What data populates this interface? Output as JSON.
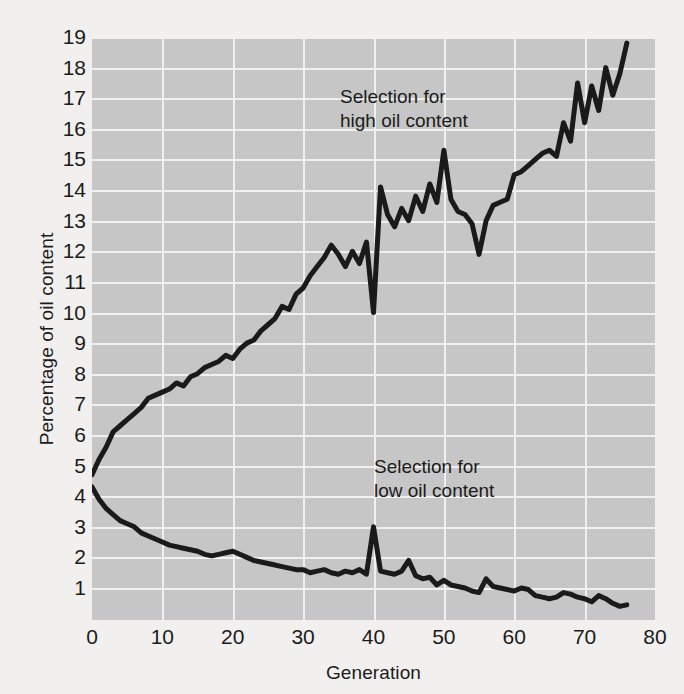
{
  "chart_data": {
    "type": "line",
    "title": "",
    "xlabel": "Generation",
    "ylabel": "Percentage of oil content",
    "xlim": [
      0,
      80
    ],
    "ylim": [
      0,
      19
    ],
    "xticks": [
      0,
      10,
      20,
      30,
      40,
      50,
      60,
      70,
      80
    ],
    "yticks": [
      1,
      2,
      3,
      4,
      5,
      6,
      7,
      8,
      9,
      10,
      11,
      12,
      13,
      14,
      15,
      16,
      17,
      18,
      19
    ],
    "grid": true,
    "legend_position": "inline-annotation",
    "plot_background": "#c6c6c6",
    "gridline_color": "#f0f0f0",
    "line_color": "#1a1a1a",
    "page_background": "#f2f0ee",
    "annotations": [
      {
        "id": "high",
        "text": "Selection for\nhigh oil content",
        "x": 25,
        "y": 16.8
      },
      {
        "id": "low",
        "text": "Selection for\nlow oil content",
        "x": 30,
        "y": 4.1
      }
    ],
    "series": [
      {
        "name": "Selection for high oil content",
        "x": [
          0,
          1,
          2,
          3,
          4,
          5,
          6,
          7,
          8,
          9,
          10,
          11,
          12,
          13,
          14,
          15,
          16,
          17,
          18,
          19,
          20,
          21,
          22,
          23,
          24,
          25,
          26,
          27,
          28,
          29,
          30,
          31,
          32,
          33,
          34,
          35,
          36,
          37,
          38,
          39,
          40,
          41,
          42,
          43,
          44,
          45,
          46,
          47,
          48,
          49,
          50,
          51,
          52,
          53,
          54,
          55,
          56,
          57,
          58,
          59,
          60,
          61,
          62,
          63,
          64,
          65,
          66,
          67,
          68,
          69,
          70,
          71,
          72,
          73,
          74,
          75,
          76
        ],
        "values": [
          4.7,
          5.2,
          5.6,
          6.1,
          6.3,
          6.5,
          6.7,
          6.9,
          7.2,
          7.3,
          7.4,
          7.5,
          7.7,
          7.6,
          7.9,
          8.0,
          8.2,
          8.3,
          8.4,
          8.6,
          8.5,
          8.8,
          9.0,
          9.1,
          9.4,
          9.6,
          9.8,
          10.2,
          10.1,
          10.6,
          10.8,
          11.2,
          11.5,
          11.8,
          12.2,
          11.9,
          11.5,
          12.0,
          11.6,
          12.3,
          10.0,
          14.1,
          13.2,
          12.8,
          13.4,
          13.0,
          13.8,
          13.3,
          14.2,
          13.6,
          15.3,
          13.7,
          13.3,
          13.2,
          12.9,
          11.9,
          13.0,
          13.5,
          13.6,
          13.7,
          14.5,
          14.6,
          14.8,
          15.0,
          15.2,
          15.3,
          15.1,
          16.2,
          15.6,
          17.5,
          16.2,
          17.4,
          16.6,
          18.0,
          17.1,
          17.8,
          18.8
        ]
      },
      {
        "name": "Selection for low oil content",
        "x": [
          0,
          1,
          2,
          3,
          4,
          5,
          6,
          7,
          8,
          9,
          10,
          11,
          12,
          13,
          14,
          15,
          16,
          17,
          18,
          19,
          20,
          21,
          22,
          23,
          24,
          25,
          26,
          27,
          28,
          29,
          30,
          31,
          32,
          33,
          34,
          35,
          36,
          37,
          38,
          39,
          40,
          41,
          42,
          43,
          44,
          45,
          46,
          47,
          48,
          49,
          50,
          51,
          52,
          53,
          54,
          55,
          56,
          57,
          58,
          59,
          60,
          61,
          62,
          63,
          64,
          65,
          66,
          67,
          68,
          69,
          70,
          71,
          72,
          73,
          74,
          75,
          76
        ],
        "values": [
          4.3,
          3.9,
          3.6,
          3.4,
          3.2,
          3.1,
          3.0,
          2.8,
          2.7,
          2.6,
          2.5,
          2.4,
          2.35,
          2.3,
          2.25,
          2.2,
          2.1,
          2.05,
          2.1,
          2.15,
          2.2,
          2.1,
          2.0,
          1.9,
          1.85,
          1.8,
          1.75,
          1.7,
          1.65,
          1.6,
          1.6,
          1.5,
          1.55,
          1.6,
          1.5,
          1.45,
          1.55,
          1.5,
          1.6,
          1.45,
          3.0,
          1.55,
          1.5,
          1.45,
          1.55,
          1.9,
          1.4,
          1.3,
          1.35,
          1.1,
          1.25,
          1.1,
          1.05,
          1.0,
          0.9,
          0.85,
          1.3,
          1.05,
          1.0,
          0.95,
          0.9,
          1.0,
          0.95,
          0.75,
          0.7,
          0.65,
          0.7,
          0.85,
          0.8,
          0.7,
          0.65,
          0.55,
          0.75,
          0.65,
          0.5,
          0.4,
          0.45
        ]
      }
    ]
  }
}
